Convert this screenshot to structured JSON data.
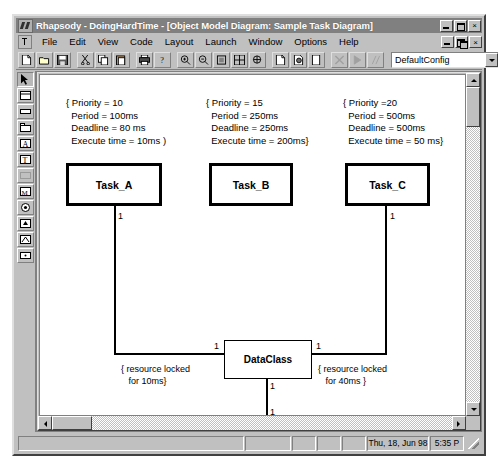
{
  "window": {
    "title": "Rhapsody - DoingHardTime - [Object Model Diagram: Sample Task Diagram]",
    "app_icon": "rhapsody-icon",
    "buttons": {
      "minimize": "_",
      "maximize": "□",
      "close": "×"
    }
  },
  "menu": {
    "items": [
      {
        "label": "File"
      },
      {
        "label": "Edit"
      },
      {
        "label": "View"
      },
      {
        "label": "Code"
      },
      {
        "label": "Layout"
      },
      {
        "label": "Launch"
      },
      {
        "label": "Window"
      },
      {
        "label": "Options"
      },
      {
        "label": "Help"
      }
    ],
    "mdi_buttons": {
      "minimize": "_",
      "restore": "❐",
      "close": "×"
    }
  },
  "toolbar": {
    "icons": [
      "new-document-icon",
      "open-folder-icon",
      "save-disk-icon",
      "cut-scissors-icon",
      "copy-icon",
      "paste-icon",
      "print-icon",
      "help-question-icon",
      "zoom-in-icon",
      "zoom-out-icon",
      "zoom-fit-icon",
      "zoom-all-icon",
      "pan-icon",
      "generate-code-icon",
      "edit-code-icon",
      "browse-icon",
      "build-icon",
      "run-icon",
      "animate-icon"
    ],
    "config_combo": {
      "value": "DefaultConfig",
      "arrow_icon": "chevron-down-icon"
    }
  },
  "palette": {
    "tools": [
      "select-arrow-icon",
      "class-box-icon",
      "note-icon",
      "package-icon",
      "actor-icon",
      "object-icon",
      "link-icon",
      "association-icon",
      "aggregation-icon",
      "inheritance-icon",
      "dependency-icon",
      "comment-anchor-icon"
    ],
    "selected_index": 0
  },
  "diagram": {
    "notes": [
      {
        "name": "task-a-constraint-note",
        "text": "{ Priority = 10\n  Period = 100ms\n  Deadline = 80 ms\n  Execute time = 10ms )"
      },
      {
        "name": "task-b-constraint-note",
        "text": "{ Priority = 15\n  Period = 250ms\n  Deadline = 250ms\n  Execute time = 200ms}"
      },
      {
        "name": "task-c-constraint-note",
        "text": "{ Priority =20\n  Period = 500ms\n  Deadline = 500ms\n  Execute time = 50 ms}"
      }
    ],
    "classes": [
      {
        "name": "class-task-a",
        "label": "Task_A"
      },
      {
        "name": "class-task-b",
        "label": "Task_B"
      },
      {
        "name": "class-task-c",
        "label": "Task_C"
      },
      {
        "name": "class-dataclass",
        "label": "DataClass"
      },
      {
        "name": "class-mutex",
        "label": "mutex"
      }
    ],
    "multiplicities": [
      {
        "name": "mult-task-a",
        "value": "1"
      },
      {
        "name": "mult-task-c",
        "value": "1"
      },
      {
        "name": "mult-dataclass-left",
        "value": "1"
      },
      {
        "name": "mult-dataclass-right",
        "value": "1"
      },
      {
        "name": "mult-dataclass-bottom",
        "value": "1"
      },
      {
        "name": "mult-mutex-top",
        "value": "1"
      }
    ],
    "constraints": [
      {
        "name": "left-resource-constraint",
        "text": "{ resource locked\n   for 10ms}"
      },
      {
        "name": "right-resource-constraint",
        "text": "{ resource locked\n   for 40ms }"
      }
    ]
  },
  "statusbar": {
    "message": "",
    "pane1": "",
    "pane2": "",
    "pane3": "",
    "pane4": "",
    "date": "Thu, 18, Jun 98",
    "time": "5:35 P"
  }
}
